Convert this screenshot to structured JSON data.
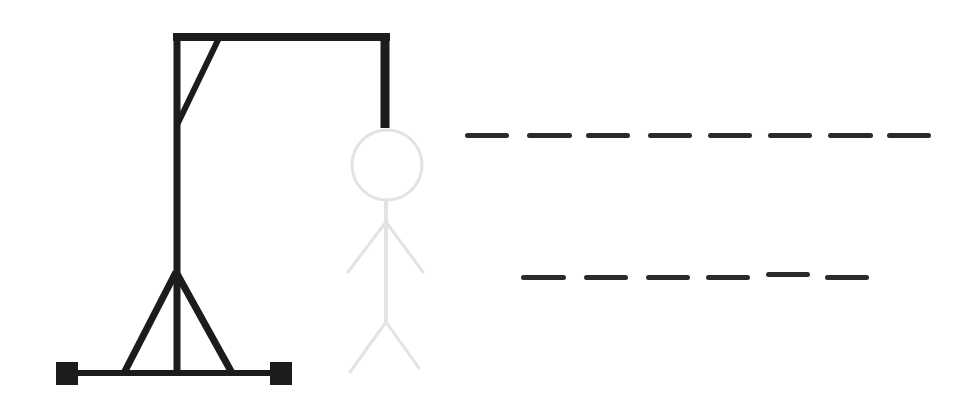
{
  "game": {
    "type": "hangman",
    "colors": {
      "gallows": "#1c1c1c",
      "figure": "#e3e3e3",
      "slot": "#2b2b2b",
      "background": "#ffffff"
    },
    "figure_parts_shown": [
      "head",
      "body",
      "left-arm",
      "right-arm",
      "left-leg",
      "right-leg"
    ],
    "word_rows": [
      {
        "row": 1,
        "slot_count": 8,
        "letters": [
          "",
          "",
          "",
          "",
          "",
          "",
          "",
          ""
        ],
        "slots": [
          {
            "x": 465,
            "y": 133,
            "w": 44
          },
          {
            "x": 527,
            "y": 133,
            "w": 45
          },
          {
            "x": 586,
            "y": 133,
            "w": 44
          },
          {
            "x": 648,
            "y": 133,
            "w": 44
          },
          {
            "x": 708,
            "y": 133,
            "w": 44
          },
          {
            "x": 768,
            "y": 133,
            "w": 44
          },
          {
            "x": 828,
            "y": 133,
            "w": 45
          },
          {
            "x": 887,
            "y": 133,
            "w": 44
          }
        ]
      },
      {
        "row": 2,
        "slot_count": 6,
        "letters": [
          "",
          "",
          "",
          "",
          "",
          ""
        ],
        "slots": [
          {
            "x": 521,
            "y": 275,
            "w": 45
          },
          {
            "x": 584,
            "y": 275,
            "w": 44
          },
          {
            "x": 646,
            "y": 275,
            "w": 44
          },
          {
            "x": 706,
            "y": 275,
            "w": 44
          },
          {
            "x": 766,
            "y": 272,
            "w": 44
          },
          {
            "x": 825,
            "y": 275,
            "w": 44
          }
        ]
      }
    ]
  }
}
